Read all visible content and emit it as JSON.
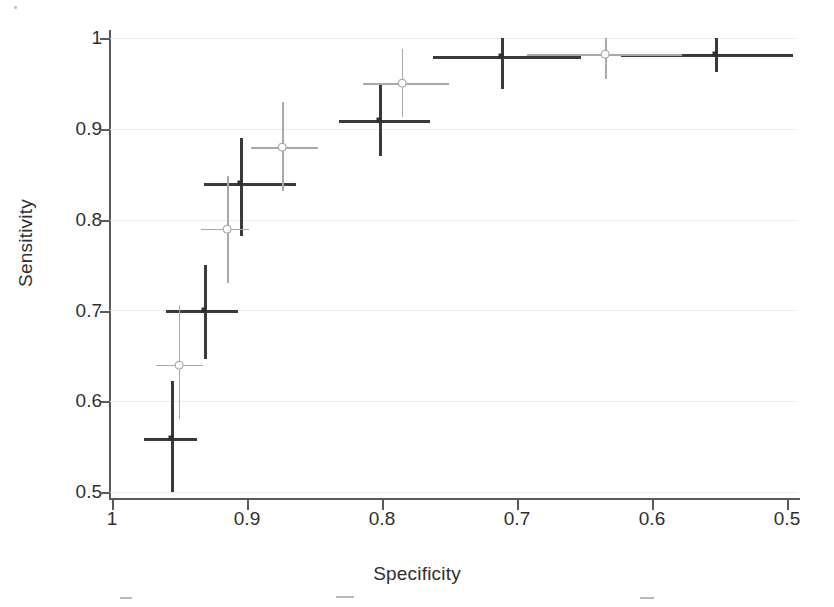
{
  "chart_data": {
    "type": "scatter",
    "title": "",
    "xlabel": "Specificity",
    "ylabel": "Sensitivity",
    "xlim": [
      1.0,
      0.49
    ],
    "ylim": [
      0.5,
      1.0
    ],
    "x_reversed": true,
    "grid": true,
    "legend": "none",
    "xticks": [
      "1",
      "0.9",
      "0.8",
      "0.7",
      "0.6",
      "0.5"
    ],
    "xtick_values": [
      1.0,
      0.9,
      0.8,
      0.7,
      0.6,
      0.5
    ],
    "yticks": [
      "0.5",
      "0.6",
      "0.7",
      "0.8",
      "0.9",
      "1"
    ],
    "ytick_values": [
      0.5,
      0.6,
      0.7,
      0.8,
      0.9,
      1.0
    ],
    "series": [
      {
        "name": "dark-series",
        "color": "#3a3a3a",
        "marker": "cross",
        "points": [
          {
            "x": 0.955,
            "y": 0.56,
            "x_low": 0.975,
            "x_high": 0.935,
            "y_low": 0.5,
            "y_high": 0.622
          },
          {
            "x": 0.93,
            "y": 0.7,
            "x_low": 0.958,
            "x_high": 0.905,
            "y_low": 0.646,
            "y_high": 0.75
          },
          {
            "x": 0.903,
            "y": 0.84,
            "x_low": 0.93,
            "x_high": 0.862,
            "y_low": 0.782,
            "y_high": 0.89
          },
          {
            "x": 0.8,
            "y": 0.91,
            "x_low": 0.83,
            "x_high": 0.762,
            "y_low": 0.87,
            "y_high": 0.95
          },
          {
            "x": 0.709,
            "y": 0.98,
            "x_low": 0.76,
            "x_high": 0.65,
            "y_low": 0.944,
            "y_high": 1.0
          },
          {
            "x": 0.55,
            "y": 0.982,
            "x_low": 0.62,
            "x_high": 0.492,
            "y_low": 0.963,
            "y_high": 1.0
          }
        ]
      },
      {
        "name": "light-series",
        "color": "#9b9b9b",
        "marker": "circle-cross",
        "points": [
          {
            "x": 0.949,
            "y": 0.64,
            "x_low": 0.966,
            "x_high": 0.931,
            "y_low": 0.58,
            "y_high": 0.706
          },
          {
            "x": 0.913,
            "y": 0.79,
            "x_low": 0.932,
            "x_high": 0.897,
            "y_low": 0.73,
            "y_high": 0.848
          },
          {
            "x": 0.872,
            "y": 0.88,
            "x_low": 0.895,
            "x_high": 0.845,
            "y_low": 0.832,
            "y_high": 0.93
          },
          {
            "x": 0.783,
            "y": 0.95,
            "x_low": 0.812,
            "x_high": 0.748,
            "y_low": 0.913,
            "y_high": 0.988
          },
          {
            "x": 0.632,
            "y": 0.982,
            "x_low": 0.69,
            "x_high": 0.575,
            "y_low": 0.955,
            "y_high": 1.0
          }
        ]
      }
    ]
  },
  "axes": {
    "x_title": "Specificity",
    "y_title": "Sensitivity"
  }
}
